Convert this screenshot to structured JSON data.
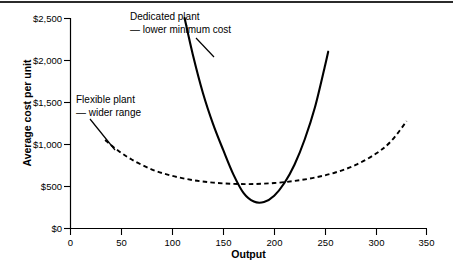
{
  "chart_data": {
    "type": "line",
    "title": "",
    "xlabel": "Output",
    "ylabel": "Average cost per unit",
    "xlim": [
      0,
      350
    ],
    "ylim": [
      0,
      2500
    ],
    "xticks": [
      0,
      50,
      100,
      150,
      200,
      250,
      300,
      350
    ],
    "xtick_labels": [
      "0",
      "50",
      "100",
      "150",
      "200",
      "250",
      "300",
      "350"
    ],
    "yticks": [
      0,
      500,
      1000,
      1500,
      2000,
      2500
    ],
    "ytick_labels": [
      "$0",
      "$500",
      "$1,000",
      "$1,500",
      "$2,000",
      "$2,500"
    ],
    "grid": false,
    "legend_position": "none",
    "series": [
      {
        "name": "Dedicated plant",
        "style": "solid",
        "color": "#000000",
        "x": [
          112,
          120,
          130,
          140,
          150,
          160,
          170,
          180,
          190,
          200,
          210,
          220,
          230,
          240,
          250,
          253
        ],
        "y": [
          2500,
          2070,
          1610,
          1240,
          930,
          640,
          420,
          320,
          315,
          390,
          540,
          760,
          1060,
          1440,
          1940,
          2100
        ]
      },
      {
        "name": "Flexible plant",
        "style": "dashed",
        "color": "#000000",
        "x": [
          34,
          45,
          60,
          80,
          100,
          120,
          140,
          160,
          180,
          200,
          220,
          240,
          260,
          280,
          300,
          315,
          330
        ],
        "y": [
          1050,
          940,
          820,
          700,
          625,
          575,
          545,
          530,
          528,
          540,
          565,
          605,
          665,
          755,
          890,
          1040,
          1275
        ]
      }
    ],
    "annotations": [
      {
        "name": "dedicated-plant-annotation",
        "line1": "Dedicated plant",
        "line2": "— lower minimum cost",
        "leader_from": [
          196,
          38
        ],
        "leader_to": [
          214,
          57
        ]
      },
      {
        "name": "flexible-plant-annotation",
        "line1": "Flexible plant",
        "line2": "— wider range",
        "leader_from": [
          90,
          119
        ],
        "leader_to": [
          115,
          150
        ]
      }
    ]
  },
  "colors": {
    "background": "#ffffff",
    "ink": "#000000",
    "top_rule": "#2b2b2b"
  }
}
